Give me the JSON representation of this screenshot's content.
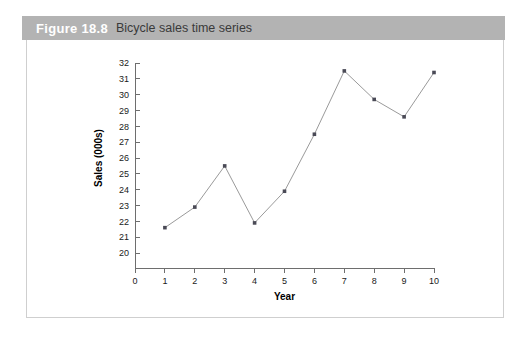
{
  "caption": {
    "figure_number": "Figure 18.8",
    "title": "Bicycle sales time series"
  },
  "chart_data": {
    "type": "line",
    "title": "Bicycle sales time series",
    "xlabel": "Year",
    "ylabel": "Sales (000s)",
    "x": [
      1,
      2,
      3,
      4,
      5,
      6,
      7,
      8,
      9,
      10
    ],
    "values": [
      21.6,
      22.9,
      25.5,
      21.9,
      23.9,
      27.5,
      31.5,
      29.7,
      28.6,
      31.4
    ],
    "xlim": [
      0,
      10
    ],
    "ylim": [
      20,
      32
    ],
    "y_axis_break": true,
    "xticks": [
      0,
      1,
      2,
      3,
      4,
      5,
      6,
      7,
      8,
      9,
      10
    ],
    "xticklabels": [
      "0",
      "1",
      "2",
      "3",
      "4",
      "5",
      "6",
      "7",
      "8",
      "9",
      "10"
    ],
    "yticks": [
      20,
      21,
      22,
      23,
      24,
      25,
      26,
      27,
      28,
      29,
      30,
      31,
      32
    ],
    "yticklabels": [
      "20",
      "21",
      "22",
      "23",
      "24",
      "25",
      "26",
      "27",
      "28",
      "29",
      "30",
      "31",
      "32"
    ],
    "grid": false,
    "legend": null,
    "marker": "square",
    "colors": {
      "line": "#9a9a9a",
      "marker": "#4a4a56",
      "axis": "#6e6e6e",
      "caption_bar": "#b3b3b3",
      "frame_border": "#cfcfcf"
    }
  }
}
